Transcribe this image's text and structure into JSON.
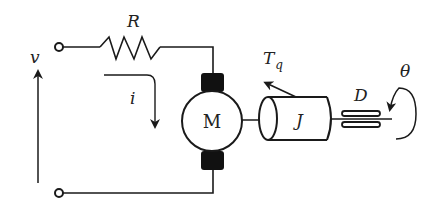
{
  "diagram": {
    "colors": {
      "stroke": "#1a1a1a",
      "brush": "#111111",
      "background": "#ffffff"
    },
    "labels": {
      "voltage": "v",
      "resistor": "R",
      "current": "i",
      "motor": "M",
      "torque_main": "T",
      "torque_sub": "q",
      "inertia": "J",
      "damping": "D",
      "angle": "θ"
    },
    "components": [
      {
        "id": "voltage-source-terminals",
        "type": "terminal-pair"
      },
      {
        "id": "resistor",
        "type": "resistor",
        "label": "R"
      },
      {
        "id": "motor",
        "type": "dc-motor",
        "label": "M"
      },
      {
        "id": "inertia",
        "type": "rotor-cylinder",
        "label": "J"
      },
      {
        "id": "damper",
        "type": "viscous-damper",
        "label": "D"
      },
      {
        "id": "rotation",
        "type": "angular-displacement",
        "label": "θ"
      }
    ]
  }
}
